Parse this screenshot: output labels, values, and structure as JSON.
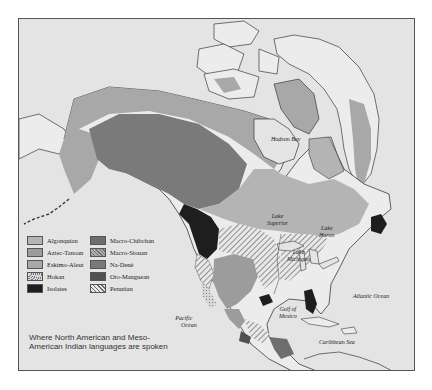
{
  "map": {
    "caption": "Where North American and Meso-American Indian languages are spoken",
    "colors": {
      "ocean": "#e4e4e4",
      "land_unshaded": "#ececec",
      "algonquian": "#b4b4b4",
      "aztec_tanoan": "#9c9c9c",
      "eskimo_aleut": "#a8a8a8",
      "isolates": "#1e1e1e",
      "macro_chibchan": "#6e6e6e",
      "na_dene": "#7a7a7a",
      "oto_manguean": "#505050",
      "coastline": "#3a3a3a"
    },
    "legend": [
      {
        "label": "Algonquian",
        "swatch": "algonquian",
        "pattern": "solid"
      },
      {
        "label": "Aztec-Tanoan",
        "swatch": "aztec_tanoan",
        "pattern": "solid"
      },
      {
        "label": "Eskimo-Aleut",
        "swatch": "eskimo_aleut",
        "pattern": "solid"
      },
      {
        "label": "Hokan",
        "swatch": "hokan",
        "pattern": "dotted"
      },
      {
        "label": "Isolates",
        "swatch": "isolates",
        "pattern": "solid"
      },
      {
        "label": "Macro-Chibchan",
        "swatch": "macro_chibchan",
        "pattern": "solid"
      },
      {
        "label": "Macro-Siouan",
        "swatch": "macro_siouan",
        "pattern": "crosshatch"
      },
      {
        "label": "Na-Dené",
        "swatch": "na_dene",
        "pattern": "solid"
      },
      {
        "label": "Oto-Manguean",
        "swatch": "oto_manguean",
        "pattern": "solid"
      },
      {
        "label": "Penutian",
        "swatch": "penutian",
        "pattern": "hatched"
      }
    ],
    "labels": {
      "hudson_bay": "Hudson Bay",
      "lake_superior_1": "Lake",
      "lake_superior_2": "Superior",
      "lake_huron_1": "Lake",
      "lake_huron_2": "Huron",
      "lake_michigan_1": "Lake",
      "lake_michigan_2": "Michigan",
      "pacific_1": "Pacific",
      "pacific_2": "Ocean",
      "gulf_1": "Gulf of",
      "gulf_2": "Mexico",
      "atlantic": "Atlantic Ocean",
      "caribbean": "Caribbean Sea"
    }
  }
}
